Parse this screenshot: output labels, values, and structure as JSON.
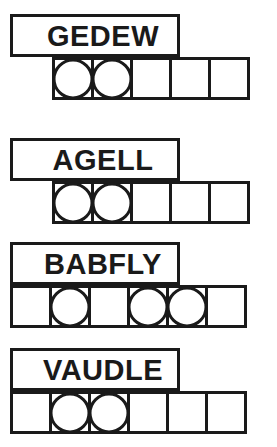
{
  "sheet": {
    "title": "Word Puzzle Answer Grid",
    "ink_color": "#1a1a1a",
    "paper_color": "#ffffff"
  },
  "puzzles": [
    {
      "word": "GEDEW",
      "top": 14,
      "strip_offset": 1,
      "cell_count": 5,
      "circled_cells": [
        0,
        1
      ],
      "cells": [
        "",
        "",
        "",
        "",
        ""
      ]
    },
    {
      "word": "AGELL",
      "top": 138,
      "strip_offset": 1,
      "cell_count": 5,
      "circled_cells": [
        0,
        1
      ],
      "cells": [
        "",
        "",
        "",
        "",
        ""
      ]
    },
    {
      "word": "BABFLY",
      "top": 242,
      "strip_offset": 0,
      "cell_count": 6,
      "circled_cells": [
        1,
        3,
        4
      ],
      "cells": [
        "",
        "",
        "",
        "",
        "",
        ""
      ]
    },
    {
      "word": "VAUDLE",
      "top": 348,
      "strip_offset": 0,
      "cell_count": 6,
      "circled_cells": [
        1,
        2
      ],
      "cells": [
        "",
        "",
        "",
        "",
        "",
        ""
      ]
    }
  ]
}
